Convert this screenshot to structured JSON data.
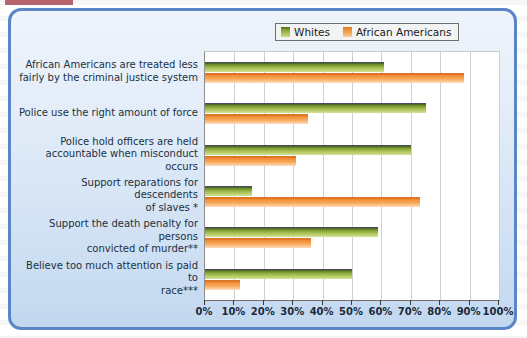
{
  "figure": {
    "marker_color": "#9e2a3a",
    "frame_color": "#5b86c6"
  },
  "legend": {
    "position": "top-right",
    "entries": [
      {
        "label": "Whites",
        "color": "#9ab545",
        "icon": "legend-swatch"
      },
      {
        "label": "African Americans",
        "color": "#f7a455",
        "icon": "legend-swatch"
      }
    ]
  },
  "chart_data": {
    "type": "bar",
    "orientation": "horizontal",
    "title": "",
    "subtitle": "",
    "xlabel": "",
    "ylabel": "",
    "xlim": [
      0,
      100
    ],
    "xticks": [
      0,
      10,
      20,
      30,
      40,
      50,
      60,
      70,
      80,
      90,
      100
    ],
    "xtick_labels": [
      "0%",
      "10%",
      "20%",
      "30%",
      "40%",
      "50%",
      "60%",
      "70%",
      "80%",
      "90%",
      "100%"
    ],
    "grid": true,
    "legend_position": "top-right",
    "categories": [
      "African Americans are treated less fairly by the criminal justice system",
      "Police use the right amount of force",
      "Police hold officers are held accountable when misconduct occurs",
      "Support reparations for descendents of slaves *",
      "Support the death penalty for persons convicted of murder**",
      "Believe too much attention is paid to race***"
    ],
    "category_lines": [
      [
        "African Americans are treated less",
        "fairly by the criminal justice system"
      ],
      [
        "Police use the right amount of force"
      ],
      [
        "Police hold officers are held",
        "accountable when misconduct occurs"
      ],
      [
        "Support reparations for descendents",
        "of slaves *"
      ],
      [
        "Support the death penalty for persons",
        "convicted of murder**"
      ],
      [
        "Believe too much attention is paid to",
        "race***"
      ]
    ],
    "series": [
      {
        "name": "Whites",
        "color": "#9ab545",
        "values": [
          61,
          75,
          70,
          16,
          59,
          50
        ]
      },
      {
        "name": "African Americans",
        "color": "#f7a455",
        "values": [
          88,
          35,
          31,
          73,
          36,
          12
        ]
      }
    ]
  }
}
